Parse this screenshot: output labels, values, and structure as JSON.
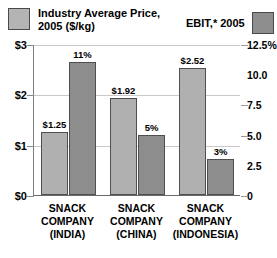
{
  "legend": {
    "price": {
      "label": "Industry Average Price,\n2005 ($/kg)",
      "swatch_color": "#b4b4b4",
      "swatch_name": "legend-swatch-price"
    },
    "ebit": {
      "label": "EBIT,* 2005",
      "swatch_color": "#8e8e8e",
      "swatch_name": "legend-swatch-ebit"
    }
  },
  "axes": {
    "left_ticks": [
      "$3",
      "$2",
      "$1",
      "$0"
    ],
    "right_ticks": [
      "12.5%",
      "10.0",
      "7.5",
      "5.0",
      "2.5",
      "0"
    ]
  },
  "chart_data": {
    "type": "bar",
    "title": "",
    "xlabel": "",
    "categories": [
      "SNACK\nCOMPANY\n(INDIA)",
      "SNACK\nCOMPANY\n(CHINA)",
      "SNACK\nCOMPANY\n(INDONESIA)"
    ],
    "series": [
      {
        "name": "Industry Average Price, 2005 ($/kg)",
        "axis": "left",
        "unit": "$/kg",
        "values": [
          1.25,
          1.92,
          2.52
        ],
        "labels": [
          "$1.25",
          "$1.92",
          "$2.52"
        ],
        "color": "#b0b0b0"
      },
      {
        "name": "EBIT,* 2005",
        "axis": "right",
        "unit": "%",
        "values": [
          11,
          5,
          3
        ],
        "labels": [
          "11%",
          "5%",
          "3%"
        ],
        "color": "#8d8d8d"
      }
    ],
    "ylim": [
      0,
      3
    ],
    "ylabel": "Industry Average Price, 2005 ($/kg)",
    "y2lim": [
      0,
      12.5
    ],
    "y2label": "EBIT,* 2005",
    "grid": true,
    "legend_position": "top"
  }
}
